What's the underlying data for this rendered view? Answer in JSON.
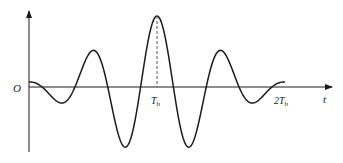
{
  "diagram": {
    "title": "",
    "origin_label": "O",
    "x_axis_label": "t",
    "tick_labels": [
      {
        "main": "T",
        "sub": "b",
        "at": 1
      },
      {
        "main": "2T",
        "sub": "b",
        "at": 2
      }
    ],
    "waveform": {
      "description": "Sinc-like pulse centered at T_b, decaying oscillation on both sides, spanning 0 to 2T_b",
      "center": 1,
      "span": [
        0,
        2
      ],
      "peak_amplitude": 1,
      "side_lobe_amplitude": 0.5,
      "min_amplitude": -0.72,
      "marker": "dashed vertical line at T_b from peak to axis"
    },
    "colors": {
      "stroke": "#1a1a1a",
      "dashed": "#555555",
      "background": "#ffffff"
    }
  }
}
